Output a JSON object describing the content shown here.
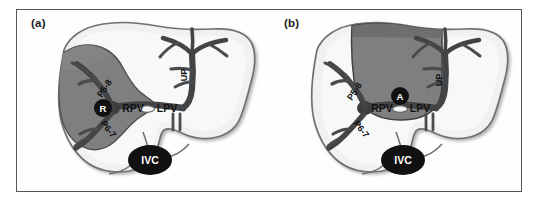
{
  "figure": {
    "frame_color": "#55565a",
    "background": "#ffffff"
  },
  "palette": {
    "liver_fill": "#eceded",
    "liver_fill_light": "#f5f6f6",
    "liver_outline": "#6f7174",
    "shaded_region": "#7e7f81",
    "shaded_region_dark": "#6a6b6d",
    "vessel": "#4a4b4d",
    "vessel_dark": "#303133",
    "marker_fill": "#111111",
    "marker_text": "#ffffff",
    "label_text": "#121212"
  },
  "panels": [
    {
      "id": "a",
      "label": "(a)",
      "shaded_marker": "R",
      "shaded_marker_title": "Right lobe territory",
      "labels": [
        {
          "name": "p58",
          "text": "P5-8",
          "rotated": true
        },
        {
          "name": "p67",
          "text": "P6-7",
          "rotated": true
        },
        {
          "name": "rpv",
          "text": "RPV",
          "rotated": false
        },
        {
          "name": "lpv",
          "text": "LPV",
          "rotated": false
        },
        {
          "name": "up",
          "text": "UP",
          "rotated": true
        },
        {
          "name": "ivc",
          "text": "IVC",
          "rotated": false
        }
      ]
    },
    {
      "id": "b",
      "label": "(b)",
      "shaded_marker": "A",
      "shaded_marker_title": "Anterior segment territory",
      "labels": [
        {
          "name": "p58",
          "text": "P5-8",
          "rotated": true
        },
        {
          "name": "p67",
          "text": "P6-7",
          "rotated": true
        },
        {
          "name": "rpv",
          "text": "RPV",
          "rotated": false
        },
        {
          "name": "lpv",
          "text": "LPV",
          "rotated": false
        },
        {
          "name": "up",
          "text": "UP",
          "rotated": true
        },
        {
          "name": "ivc",
          "text": "IVC",
          "rotated": false
        }
      ]
    }
  ],
  "glossary": {
    "RPV": "right portal vein",
    "LPV": "left portal vein",
    "UP": "umbilical portion",
    "IVC": "inferior vena cava",
    "P5-8": "portal branches to segments 5 and 8",
    "P6-7": "portal branches to segments 6 and 7",
    "R": "right",
    "A": "anterior"
  }
}
